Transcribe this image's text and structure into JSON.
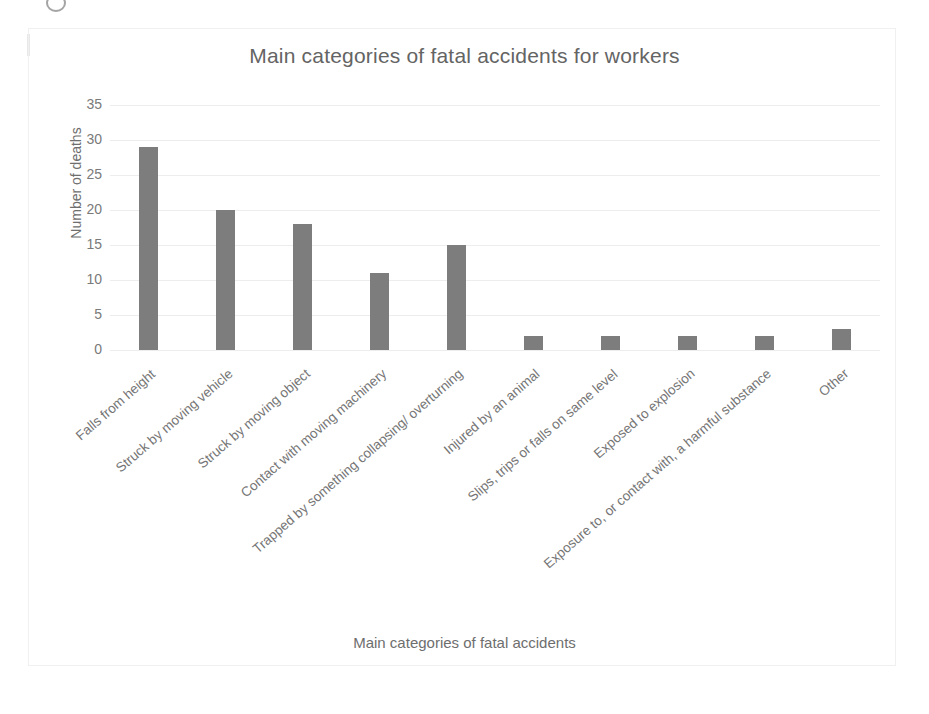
{
  "chart_data": {
    "type": "bar",
    "title": "Main categories of fatal accidents for workers",
    "xlabel": "Main categories of fatal accidents",
    "ylabel": "Number of deaths",
    "ylim": [
      0,
      35
    ],
    "ytick_labels": [
      "35",
      "30",
      "25",
      "20",
      "15",
      "10",
      "5",
      "0"
    ],
    "ytick_values": [
      35,
      30,
      25,
      20,
      15,
      10,
      5,
      0
    ],
    "grid": true,
    "legend": "none",
    "bar_color": "#7d7d7d",
    "categories": [
      "Falls from height",
      "Struck by moving vehicle",
      "Struck by moving object",
      "Contact with moving machinery",
      "Trapped by something collapsing/ overturning",
      "Injured by an animal",
      "Slips, trips or falls on same level",
      "Exposed to explosion",
      "Exposure to, or contact with, a harmful substance",
      "Other"
    ],
    "values": [
      29,
      20,
      18,
      11,
      15,
      2,
      2,
      2,
      2,
      3
    ]
  }
}
